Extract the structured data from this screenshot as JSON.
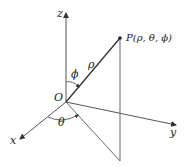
{
  "diagram": {
    "labels": {
      "z_axis": "z",
      "x_axis": "x",
      "y_axis": "y",
      "origin": "O",
      "point": "P(ρ, θ, ϕ)",
      "rho": "ρ",
      "phi": "ϕ",
      "theta": "θ"
    },
    "colors": {
      "line": "#555555",
      "text": "#222222",
      "background": "#ffffff"
    }
  }
}
